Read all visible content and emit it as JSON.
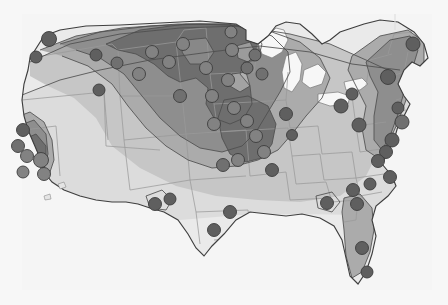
{
  "figure": {
    "title": "",
    "type": "contour-choropleth-map",
    "region": "Contiguous United States",
    "background_color": "#f7f7f7",
    "outline_color": "#4a4a4a",
    "state_border_color": "#9a9a9a",
    "marker_color": "#5f5f5f",
    "marker_stroke": "#3c3c3c",
    "legend_visible": false,
    "axis_visible": false,
    "labels_visible": false
  },
  "chart_data": {
    "type": "heatmap",
    "title": "",
    "subtitle": "",
    "xlabel": "",
    "ylabel": "",
    "grid": false,
    "legend_position": "none",
    "projection": "albers-usa-approx",
    "shading_scale": {
      "name": "grayscale-contour-bands",
      "bands": [
        {
          "level": 1,
          "label": "lowest",
          "color": "#eaeaea"
        },
        {
          "level": 2,
          "label": "low",
          "color": "#dcdcdc"
        },
        {
          "level": 3,
          "label": "moderate",
          "color": "#c6c6c6"
        },
        {
          "level": 4,
          "label": "elevated",
          "color": "#ababab"
        },
        {
          "level": 5,
          "label": "high",
          "color": "#8e8e8e"
        },
        {
          "level": 6,
          "label": "highest",
          "color": "#6e6e6e"
        }
      ]
    },
    "regions": [
      {
        "name": "pacific-northwest",
        "level": 3
      },
      {
        "name": "northern-rockies",
        "level": 4
      },
      {
        "name": "northern-plains",
        "level": 6
      },
      {
        "name": "upper-midwest",
        "level": 6
      },
      {
        "name": "central-plains",
        "level": 5
      },
      {
        "name": "missouri-valley",
        "level": 6
      },
      {
        "name": "great-lakes",
        "level": 4
      },
      {
        "name": "ohio-valley",
        "level": 3
      },
      {
        "name": "northeast-corridor",
        "level": 4
      },
      {
        "name": "southern-california",
        "level": 6
      },
      {
        "name": "central-california",
        "level": 4
      },
      {
        "name": "desert-southwest",
        "level": 3
      },
      {
        "name": "great-basin",
        "level": 2
      },
      {
        "name": "southern-plains",
        "level": 2
      },
      {
        "name": "gulf-coast",
        "level": 1
      },
      {
        "name": "southeast",
        "level": 2
      },
      {
        "name": "florida-peninsula",
        "level": 3
      }
    ],
    "markers": [
      {
        "name": "seattle",
        "x": 49,
        "y": 39,
        "r": 7.5,
        "level": 4
      },
      {
        "name": "portland",
        "x": 36,
        "y": 57,
        "r": 6.0,
        "level": 3
      },
      {
        "name": "spokane",
        "x": 96,
        "y": 55,
        "r": 6.0,
        "level": 4
      },
      {
        "name": "boise",
        "x": 99,
        "y": 90,
        "r": 6.0,
        "level": 3
      },
      {
        "name": "sacramento",
        "x": 23,
        "y": 130,
        "r": 6.5,
        "level": 4
      },
      {
        "name": "san-francisco",
        "x": 18,
        "y": 146,
        "r": 6.5,
        "level": 5
      },
      {
        "name": "bakersfield",
        "x": 27,
        "y": 156,
        "r": 6.5,
        "level": 6
      },
      {
        "name": "los-angeles",
        "x": 41,
        "y": 160,
        "r": 7.5,
        "level": 6
      },
      {
        "name": "san-diego",
        "x": 44,
        "y": 174,
        "r": 6.5,
        "level": 6
      },
      {
        "name": "las-vegas",
        "x": 23,
        "y": 172,
        "r": 6.0,
        "level": 6
      },
      {
        "name": "phoenix",
        "x": 155,
        "y": 204,
        "r": 6.5,
        "level": 4
      },
      {
        "name": "tucson",
        "x": 170,
        "y": 199,
        "r": 6.0,
        "level": 4
      },
      {
        "name": "denver",
        "x": 180,
        "y": 96,
        "r": 6.5,
        "level": 5
      },
      {
        "name": "billings",
        "x": 117,
        "y": 63,
        "r": 6.0,
        "level": 5
      },
      {
        "name": "bismarck",
        "x": 152,
        "y": 52,
        "r": 6.5,
        "level": 6
      },
      {
        "name": "fargo",
        "x": 183,
        "y": 44,
        "r": 6.5,
        "level": 6
      },
      {
        "name": "minot",
        "x": 169,
        "y": 62,
        "r": 6.5,
        "level": 6
      },
      {
        "name": "rapid-city",
        "x": 139,
        "y": 74,
        "r": 6.5,
        "level": 6
      },
      {
        "name": "sioux-falls",
        "x": 206,
        "y": 68,
        "r": 6.5,
        "level": 6
      },
      {
        "name": "minneapolis",
        "x": 232,
        "y": 50,
        "r": 6.5,
        "level": 6
      },
      {
        "name": "duluth",
        "x": 231,
        "y": 32,
        "r": 6.0,
        "level": 6
      },
      {
        "name": "omaha",
        "x": 212,
        "y": 96,
        "r": 6.5,
        "level": 6
      },
      {
        "name": "des-moines",
        "x": 228,
        "y": 80,
        "r": 6.5,
        "level": 6
      },
      {
        "name": "cedar-rapids",
        "x": 247,
        "y": 68,
        "r": 6.0,
        "level": 5
      },
      {
        "name": "madison",
        "x": 255,
        "y": 55,
        "r": 6.0,
        "level": 5
      },
      {
        "name": "milwaukee",
        "x": 262,
        "y": 74,
        "r": 6.0,
        "level": 5
      },
      {
        "name": "kansas-city",
        "x": 234,
        "y": 108,
        "r": 6.5,
        "level": 6
      },
      {
        "name": "wichita",
        "x": 214,
        "y": 124,
        "r": 6.5,
        "level": 6
      },
      {
        "name": "topeka",
        "x": 247,
        "y": 121,
        "r": 6.5,
        "level": 6
      },
      {
        "name": "springfield-mo",
        "x": 256,
        "y": 136,
        "r": 6.5,
        "level": 6
      },
      {
        "name": "st-louis",
        "x": 264,
        "y": 152,
        "r": 6.5,
        "level": 6
      },
      {
        "name": "tulsa",
        "x": 238,
        "y": 160,
        "r": 6.5,
        "level": 6
      },
      {
        "name": "oklahoma-city",
        "x": 223,
        "y": 165,
        "r": 6.5,
        "level": 5
      },
      {
        "name": "memphis",
        "x": 272,
        "y": 170,
        "r": 6.5,
        "level": 4
      },
      {
        "name": "chicago",
        "x": 286,
        "y": 114,
        "r": 6.5,
        "level": 4
      },
      {
        "name": "indianapolis",
        "x": 292,
        "y": 135,
        "r": 5.5,
        "level": 4
      },
      {
        "name": "cleveland",
        "x": 341,
        "y": 106,
        "r": 7.0,
        "level": 4
      },
      {
        "name": "pittsburgh",
        "x": 359,
        "y": 125,
        "r": 7.0,
        "level": 3
      },
      {
        "name": "buffalo",
        "x": 352,
        "y": 94,
        "r": 6.0,
        "level": 3
      },
      {
        "name": "portland-me",
        "x": 413,
        "y": 44,
        "r": 7.0,
        "level": 4
      },
      {
        "name": "boston",
        "x": 388,
        "y": 77,
        "r": 7.5,
        "level": 4
      },
      {
        "name": "hartford",
        "x": 398,
        "y": 108,
        "r": 6.0,
        "level": 4
      },
      {
        "name": "new-york",
        "x": 402,
        "y": 122,
        "r": 7.0,
        "level": 5
      },
      {
        "name": "philadelphia",
        "x": 392,
        "y": 140,
        "r": 7.0,
        "level": 4
      },
      {
        "name": "baltimore",
        "x": 386,
        "y": 152,
        "r": 6.5,
        "level": 4
      },
      {
        "name": "washington-dc",
        "x": 378,
        "y": 161,
        "r": 6.5,
        "level": 4
      },
      {
        "name": "norfolk",
        "x": 390,
        "y": 177,
        "r": 6.5,
        "level": 3
      },
      {
        "name": "raleigh",
        "x": 370,
        "y": 184,
        "r": 6.0,
        "level": 3
      },
      {
        "name": "charlotte",
        "x": 353,
        "y": 190,
        "r": 6.5,
        "level": 3
      },
      {
        "name": "atlanta",
        "x": 327,
        "y": 203,
        "r": 6.5,
        "level": 3
      },
      {
        "name": "dallas",
        "x": 230,
        "y": 212,
        "r": 6.5,
        "level": 2
      },
      {
        "name": "san-antonio",
        "x": 214,
        "y": 230,
        "r": 6.5,
        "level": 2
      },
      {
        "name": "jacksonville",
        "x": 357,
        "y": 204,
        "r": 6.5,
        "level": 3
      },
      {
        "name": "orlando",
        "x": 362,
        "y": 248,
        "r": 6.5,
        "level": 3
      },
      {
        "name": "miami",
        "x": 367,
        "y": 272,
        "r": 6.0,
        "level": 3
      }
    ],
    "marker_count": 56
  }
}
